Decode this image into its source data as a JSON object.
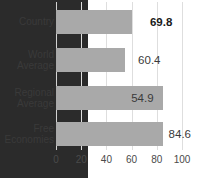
{
  "chart_data": {
    "type": "bar",
    "orientation": "horizontal",
    "title": "",
    "subtitle": "",
    "xlabel": "",
    "ylabel": "",
    "categories": [
      "Country",
      "World\nAverage",
      "Regional\nAverage",
      "Free\nEconomies"
    ],
    "values": [
      69.8,
      60.4,
      54.9,
      84.6
    ],
    "value_labels": [
      "69.8",
      "60.4",
      "54.9",
      "84.6"
    ],
    "xlim": [
      0,
      100
    ],
    "xticks": [
      0,
      20,
      40,
      60,
      80,
      100
    ],
    "xtick_labels": [
      "0",
      "20",
      "40",
      "60",
      "80",
      "100"
    ],
    "grid": true,
    "grid_axis": "x",
    "legend": false,
    "legend_position": "none",
    "bar_colors": [
      "#2b2b2b",
      "#a9a9a9",
      "#a9a9a9",
      "#a9a9a9"
    ],
    "highlight_index": 0,
    "bold_label_index": 0
  },
  "colors": {
    "background": "#ffffff",
    "highlight_bar": "#2b2b2b",
    "default_bar": "#a9a9a9",
    "gridline": "#dedede",
    "axis_text": "#4a4a4a",
    "label_text": "#3a3a3a"
  }
}
